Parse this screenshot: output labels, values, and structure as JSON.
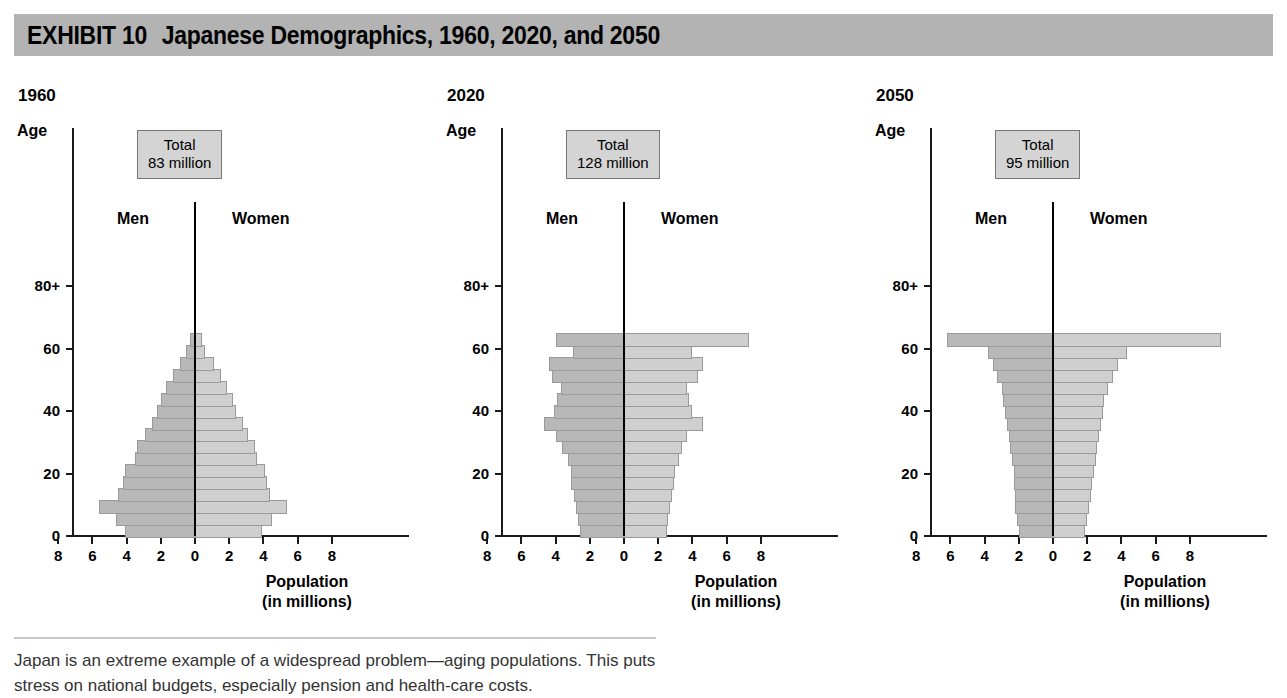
{
  "header": {
    "exhibit_number": "EXHIBIT 10",
    "title": "Japanese Demographics, 1960, 2020, and 2050",
    "band_color": "#b3b3b3"
  },
  "caption": {
    "line1": "Japan is an extreme example of a widespread problem—aging populations. This puts",
    "line2": "stress on national budgets, especially pension and health-care costs."
  },
  "axis": {
    "y_label": "Age",
    "y_ticks": [
      "0",
      "20",
      "40",
      "60",
      "80+"
    ],
    "x_ticks": [
      "8",
      "6",
      "4",
      "2",
      "0",
      "2",
      "4",
      "6",
      "8"
    ],
    "x_title_line1": "Population",
    "x_title_line2": "(in millions)",
    "men_label": "Men",
    "women_label": "Women",
    "total_word": "Total"
  },
  "colors": {
    "men_bar": "#b8b8b8",
    "women_bar": "#cfcfcf",
    "bar_border": "#9a9a9a",
    "axis": "#1a1a1a",
    "total_box_fill": "#d4d4d4"
  },
  "chart_data": {
    "type": "bar",
    "subtype": "population-pyramid",
    "title": "Japanese Demographics, 1960, 2020, and 2050",
    "xlabel": "Population (in millions)",
    "ylabel": "Age",
    "xlim": [
      -9,
      9
    ],
    "xtick_values": [
      -8,
      -6,
      -4,
      -2,
      0,
      2,
      4,
      6,
      8
    ],
    "xtick_labels": [
      "8",
      "6",
      "4",
      "2",
      "0",
      "2",
      "4",
      "6",
      "8"
    ],
    "ytick_values": [
      0,
      20,
      40,
      60,
      80
    ],
    "ytick_labels": [
      "0",
      "20",
      "40",
      "60",
      "80+"
    ],
    "age_groups": [
      "0-4",
      "5-9",
      "10-14",
      "15-19",
      "20-24",
      "25-29",
      "30-34",
      "35-39",
      "40-44",
      "45-49",
      "50-54",
      "55-59",
      "60-64",
      "65-69",
      "70-74",
      "75-79",
      "80+"
    ],
    "grid": false,
    "legend": [
      "Men",
      "Women"
    ],
    "panels": [
      {
        "year": "1960",
        "total_label": "83 million",
        "total_millions": 83,
        "series": [
          {
            "name": "Men",
            "values": [
              4.1,
              4.6,
              5.6,
              4.5,
              4.2,
              4.1,
              3.5,
              3.4,
              2.9,
              2.5,
              2.2,
              2.0,
              1.7,
              1.3,
              0.9,
              0.5,
              0.3
            ]
          },
          {
            "name": "Women",
            "values": [
              3.9,
              4.5,
              5.4,
              4.4,
              4.2,
              4.1,
              3.6,
              3.5,
              3.1,
              2.8,
              2.4,
              2.2,
              1.9,
              1.5,
              1.1,
              0.6,
              0.4
            ]
          }
        ]
      },
      {
        "year": "2020",
        "total_label": "128 million",
        "total_millions": 128,
        "series": [
          {
            "name": "Men",
            "values": [
              2.6,
              2.7,
              2.8,
              2.9,
              3.1,
              3.1,
              3.3,
              3.6,
              4.0,
              4.7,
              4.1,
              3.9,
              3.7,
              4.2,
              4.4,
              3.0,
              4.0
            ]
          },
          {
            "name": "Women",
            "values": [
              2.5,
              2.6,
              2.7,
              2.8,
              2.9,
              3.0,
              3.2,
              3.4,
              3.7,
              4.6,
              4.0,
              3.8,
              3.7,
              4.3,
              4.6,
              4.0,
              7.3
            ]
          }
        ]
      },
      {
        "year": "2050",
        "total_label": "95 million",
        "total_millions": 95,
        "series": [
          {
            "name": "Men",
            "values": [
              2.0,
              2.1,
              2.2,
              2.2,
              2.3,
              2.3,
              2.4,
              2.5,
              2.6,
              2.7,
              2.8,
              2.9,
              3.0,
              3.3,
              3.5,
              3.8,
              6.2
            ]
          },
          {
            "name": "Women",
            "values": [
              1.9,
              2.0,
              2.1,
              2.2,
              2.3,
              2.4,
              2.5,
              2.6,
              2.7,
              2.8,
              2.9,
              3.0,
              3.2,
              3.5,
              3.8,
              4.3,
              9.8
            ]
          }
        ]
      }
    ]
  }
}
